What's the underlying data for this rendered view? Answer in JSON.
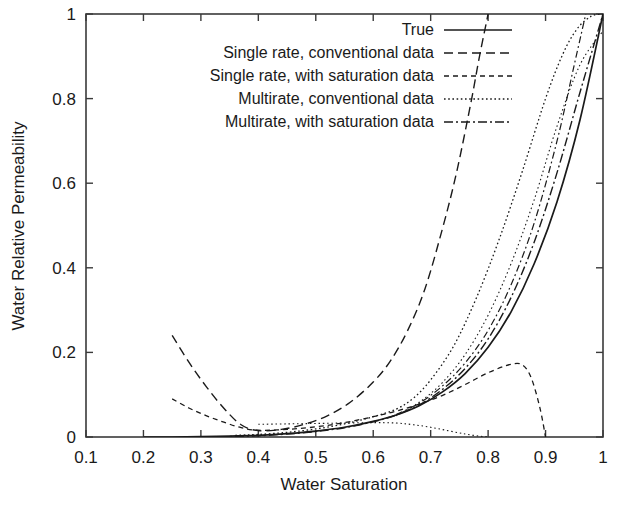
{
  "chart_data": {
    "type": "line",
    "title": "",
    "xlabel": "Water Saturation",
    "ylabel": "Water Relative Permeability",
    "xlim": [
      0.1,
      1.0
    ],
    "ylim": [
      0.0,
      1.0
    ],
    "xticks": [
      "0.1",
      "0.2",
      "0.3",
      "0.4",
      "0.5",
      "0.6",
      "0.7",
      "0.8",
      "0.9",
      "1"
    ],
    "xtick_values": [
      0.1,
      0.2,
      0.3,
      0.4,
      0.5,
      0.6,
      0.7,
      0.8,
      0.9,
      1.0
    ],
    "yticks": [
      "0",
      "0.2",
      "0.4",
      "0.6",
      "0.8",
      "1"
    ],
    "ytick_values": [
      0.0,
      0.2,
      0.4,
      0.6,
      0.8,
      1.0
    ],
    "grid": false,
    "legend_position": "top-right-inside",
    "series": [
      {
        "name": "True",
        "style": "solid",
        "dash": "none",
        "color": "#1a1a1a",
        "width": 1.7,
        "x": [
          0.2,
          0.25,
          0.3,
          0.35,
          0.4,
          0.45,
          0.5,
          0.55,
          0.6,
          0.64,
          0.68,
          0.72,
          0.76,
          0.8,
          0.84,
          0.88,
          0.92,
          0.96,
          1.0
        ],
        "y": [
          0.0,
          0.0,
          0.001,
          0.002,
          0.004,
          0.008,
          0.014,
          0.023,
          0.037,
          0.052,
          0.074,
          0.106,
          0.15,
          0.212,
          0.296,
          0.409,
          0.556,
          0.75,
          1.0
        ]
      },
      {
        "name": "Single rate, conventional data",
        "style": "dashed",
        "dash": "9,5",
        "color": "#1a1a1a",
        "width": 1.4,
        "x": [
          0.25,
          0.28,
          0.31,
          0.34,
          0.37,
          0.4,
          0.44,
          0.48,
          0.52,
          0.56,
          0.6,
          0.63,
          0.66,
          0.69,
          0.72,
          0.745,
          0.77,
          0.785,
          0.8
        ],
        "y": [
          0.24,
          0.175,
          0.118,
          0.068,
          0.029,
          0.015,
          0.018,
          0.03,
          0.05,
          0.082,
          0.13,
          0.18,
          0.252,
          0.35,
          0.49,
          0.625,
          0.79,
          0.9,
          1.0
        ]
      },
      {
        "name": "Single rate, with saturation data",
        "style": "medium-dash",
        "dash": "5,4",
        "color": "#1a1a1a",
        "width": 1.3,
        "x": [
          0.25,
          0.28,
          0.31,
          0.34,
          0.37,
          0.4,
          0.45,
          0.5,
          0.55,
          0.6,
          0.64,
          0.68,
          0.72,
          0.76,
          0.8,
          0.84,
          0.86,
          0.875,
          0.89,
          0.9
        ],
        "y": [
          0.09,
          0.068,
          0.05,
          0.035,
          0.022,
          0.016,
          0.018,
          0.024,
          0.034,
          0.048,
          0.061,
          0.078,
          0.098,
          0.124,
          0.152,
          0.172,
          0.17,
          0.14,
          0.07,
          0.0
        ]
      },
      {
        "name": "Multirate, conventional data",
        "style": "dotted",
        "dash": "1.6,2.6",
        "color": "#1a1a1a",
        "width": 1.3,
        "x": [
          0.36,
          0.4,
          0.45,
          0.5,
          0.55,
          0.6,
          0.64,
          0.67,
          0.7,
          0.74,
          0.78,
          0.82,
          0.86,
          0.9,
          0.93,
          0.955,
          0.98,
          1.0
        ],
        "y": [
          0.004,
          0.006,
          0.011,
          0.019,
          0.031,
          0.048,
          0.066,
          0.092,
          0.135,
          0.215,
          0.33,
          0.47,
          0.63,
          0.8,
          0.905,
          0.965,
          0.995,
          1.0
        ]
      },
      {
        "name": "Multirate, with saturation data",
        "style": "dash-dot",
        "dash": "9,3,2,3",
        "color": "#1a1a1a",
        "width": 1.4,
        "x": [
          0.3,
          0.35,
          0.4,
          0.45,
          0.5,
          0.55,
          0.6,
          0.64,
          0.68,
          0.72,
          0.76,
          0.8,
          0.84,
          0.88,
          0.92,
          0.96,
          1.0
        ],
        "y": [
          0.0,
          0.001,
          0.003,
          0.007,
          0.013,
          0.022,
          0.036,
          0.052,
          0.076,
          0.112,
          0.162,
          0.232,
          0.33,
          0.46,
          0.625,
          0.815,
          1.0
        ]
      },
      {
        "name": "extra-low-branch",
        "style": "dotted-fine",
        "dash": "1.5,2.8",
        "color": "#1a1a1a",
        "width": 1.1,
        "x": [
          0.4,
          0.45,
          0.5,
          0.55,
          0.6,
          0.64,
          0.67,
          0.7,
          0.73,
          0.76,
          0.785,
          0.8
        ],
        "y": [
          0.03,
          0.031,
          0.032,
          0.033,
          0.034,
          0.033,
          0.029,
          0.023,
          0.015,
          0.007,
          0.002,
          0.0
        ]
      },
      {
        "name": "extra-steep-branch",
        "style": "dotted-fine",
        "dash": "1.5,2.8",
        "color": "#1a1a1a",
        "width": 1.1,
        "x": [
          0.64,
          0.68,
          0.72,
          0.76,
          0.8,
          0.84,
          0.88,
          0.92,
          0.96,
          1.0
        ],
        "y": [
          0.05,
          0.082,
          0.128,
          0.195,
          0.288,
          0.41,
          0.56,
          0.735,
          0.88,
          0.96
        ]
      },
      {
        "name": "extra-mid-branch",
        "style": "dash-dot-fine",
        "dash": "7,3,1.8,3",
        "color": "#1a1a1a",
        "width": 1.2,
        "x": [
          0.64,
          0.68,
          0.72,
          0.76,
          0.8,
          0.84,
          0.88,
          0.92,
          0.95,
          0.97
        ],
        "y": [
          0.053,
          0.08,
          0.12,
          0.175,
          0.252,
          0.36,
          0.505,
          0.7,
          0.88,
          1.0
        ]
      }
    ],
    "legend_entries": [
      {
        "label": "True",
        "style": "solid",
        "dash": "none",
        "width": 1.7
      },
      {
        "label": "Single rate, conventional data",
        "style": "dashed",
        "dash": "9,5",
        "width": 1.4
      },
      {
        "label": "Single rate, with saturation data",
        "style": "medium-dash",
        "dash": "5,4",
        "width": 1.3
      },
      {
        "label": "Multirate, conventional data",
        "style": "dotted",
        "dash": "1.6,2.6",
        "width": 1.3
      },
      {
        "label": "Multirate, with saturation data",
        "style": "dash-dot",
        "dash": "9,3,2,3",
        "width": 1.4
      }
    ]
  },
  "plot": {
    "frame_color": "#3a3a3a",
    "background": "#ffffff",
    "left": 86,
    "right": 603,
    "top": 14,
    "bottom": 437
  }
}
